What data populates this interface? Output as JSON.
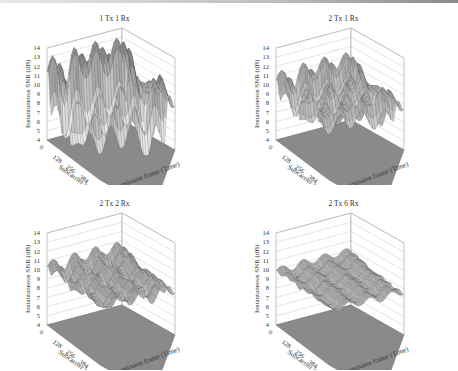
{
  "figure": {
    "panels": [
      {
        "title": "1 Tx 1 Rx"
      },
      {
        "title": "2 Tx 1 Rx"
      },
      {
        "title": "2 Tx 2 Rx"
      },
      {
        "title": "2 Tx 6 Rx"
      }
    ],
    "zlabel": "Instantaneous SNR (dB)",
    "xlabel": "Subcarrier index",
    "ylabel": "Transmission frame (Time)",
    "z_ticks": [
      "4",
      "5",
      "6",
      "7",
      "8",
      "9",
      "10",
      "11",
      "12",
      "13",
      "14"
    ],
    "x_ticks": [
      "0",
      "128",
      "256",
      "384",
      "512"
    ],
    "y_ticks": [
      "0",
      "25",
      "50",
      "75",
      "100",
      "125",
      "150"
    ]
  },
  "chart_data": [
    {
      "type": "surface3d",
      "title": "1 Tx 1 Rx",
      "xlabel": "Subcarrier index",
      "ylabel": "Transmission frame (Time)",
      "zlabel": "Instantaneous SNR (dB)",
      "x_range": [
        0,
        512
      ],
      "y_range": [
        0,
        150
      ],
      "zlim": [
        4,
        14
      ],
      "x_ticks": [
        0,
        128,
        256,
        384,
        512
      ],
      "y_ticks": [
        0,
        25,
        50,
        75,
        100,
        125,
        150
      ],
      "z_ticks": [
        4,
        5,
        6,
        7,
        8,
        9,
        10,
        11,
        12,
        13,
        14
      ],
      "approx_snr_range_db": [
        4,
        14
      ]
    },
    {
      "type": "surface3d",
      "title": "2 Tx 1 Rx",
      "xlabel": "Subcarrier index",
      "ylabel": "Transmission frame (Time)",
      "zlabel": "Instantaneous SNR (dB)",
      "x_range": [
        0,
        512
      ],
      "y_range": [
        0,
        150
      ],
      "zlim": [
        4,
        14
      ],
      "x_ticks": [
        0,
        128,
        256,
        384,
        512
      ],
      "y_ticks": [
        0,
        25,
        50,
        75,
        100,
        125,
        150
      ],
      "z_ticks": [
        4,
        5,
        6,
        7,
        8,
        9,
        10,
        11,
        12,
        13,
        14
      ],
      "approx_snr_range_db": [
        6.5,
        13
      ]
    },
    {
      "type": "surface3d",
      "title": "2 Tx 2 Rx",
      "xlabel": "Subcarrier index",
      "ylabel": "Transmission frame (Time)",
      "zlabel": "Instantaneous SNR (dB)",
      "x_range": [
        0,
        512
      ],
      "y_range": [
        0,
        150
      ],
      "zlim": [
        4,
        14
      ],
      "x_ticks": [
        0,
        128,
        256,
        384,
        512
      ],
      "y_ticks": [
        0,
        25,
        50,
        75,
        100,
        125,
        150
      ],
      "z_ticks": [
        4,
        5,
        6,
        7,
        8,
        9,
        10,
        11,
        12,
        13,
        14
      ],
      "approx_snr_range_db": [
        8,
        12
      ]
    },
    {
      "type": "surface3d",
      "title": "2 Tx 6 Rx",
      "xlabel": "Subcarrier index",
      "ylabel": "Transmission frame (Time)",
      "zlabel": "Instantaneous SNR (dB)",
      "x_range": [
        0,
        512
      ],
      "y_range": [
        0,
        150
      ],
      "zlim": [
        4,
        14
      ],
      "x_ticks": [
        0,
        128,
        256,
        384,
        512
      ],
      "y_ticks": [
        0,
        25,
        50,
        75,
        100,
        125,
        150
      ],
      "z_ticks": [
        4,
        5,
        6,
        7,
        8,
        9,
        10,
        11,
        12,
        13,
        14
      ],
      "approx_snr_range_db": [
        8.5,
        11
      ]
    }
  ]
}
